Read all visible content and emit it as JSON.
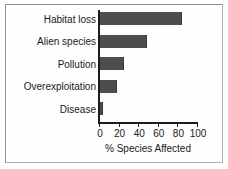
{
  "chart_data": {
    "type": "bar",
    "orientation": "horizontal",
    "title": "",
    "subtitle": "",
    "xlabel": "% Species Affected",
    "ylabel": "",
    "categories": [
      "Habitat loss",
      "Alien species",
      "Pollution",
      "Overexploitation",
      "Disease"
    ],
    "values": [
      84,
      48,
      24,
      17,
      3
    ],
    "xlim": [
      0,
      100
    ],
    "xticks": [
      0,
      20,
      40,
      60,
      80,
      100
    ],
    "xticklabels": [
      "0",
      "20",
      "40",
      "60",
      "80",
      "100"
    ],
    "grid": false,
    "legend": null,
    "series": [
      {
        "name": "% Species Affected",
        "values": [
          84,
          48,
          24,
          17,
          3
        ]
      }
    ],
    "colors": {
      "bar_fill": "#4d4d4d",
      "bar_edge": "#3a3a3a",
      "axis": "#1c1c1c",
      "text": "#1a1a1a",
      "background": "#ffffff",
      "frame_border": "#9a9a9a"
    }
  }
}
